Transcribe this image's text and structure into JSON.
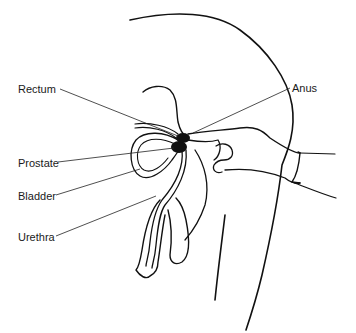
{
  "figure": {
    "labels": {
      "rectum": "Rectum",
      "anus": "Anus",
      "prostate": "Prostate",
      "bladder": "Bladder",
      "urethra": "Urethra"
    }
  },
  "colors": {
    "ink": "#111111",
    "background": "#ffffff"
  }
}
